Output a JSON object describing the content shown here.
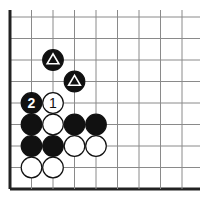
{
  "diagram": {
    "type": "go-board-fragment",
    "columns": 9,
    "rows": 9,
    "edges": [
      "left",
      "bottom"
    ],
    "colors": {
      "line": "#8a8a8a",
      "edge": "#222222",
      "black": "#111111",
      "white": "#ffffff"
    },
    "stones": [
      {
        "col": 2,
        "row": 2,
        "color": "black",
        "mark": "triangle"
      },
      {
        "col": 3,
        "row": 3,
        "color": "black",
        "mark": "triangle"
      },
      {
        "col": 1,
        "row": 4,
        "color": "black",
        "label": "2"
      },
      {
        "col": 2,
        "row": 4,
        "color": "white",
        "label": "1"
      },
      {
        "col": 1,
        "row": 5,
        "color": "black"
      },
      {
        "col": 2,
        "row": 5,
        "color": "white"
      },
      {
        "col": 3,
        "row": 5,
        "color": "black"
      },
      {
        "col": 4,
        "row": 5,
        "color": "black"
      },
      {
        "col": 1,
        "row": 6,
        "color": "black"
      },
      {
        "col": 2,
        "row": 6,
        "color": "black"
      },
      {
        "col": 3,
        "row": 6,
        "color": "white"
      },
      {
        "col": 4,
        "row": 6,
        "color": "white"
      },
      {
        "col": 1,
        "row": 7,
        "color": "white"
      },
      {
        "col": 2,
        "row": 7,
        "color": "white"
      }
    ]
  }
}
